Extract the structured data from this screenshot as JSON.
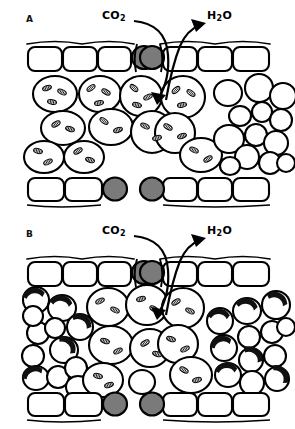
{
  "figure": {
    "background_color": "#ffffff",
    "line_color": "#000000",
    "guard_cell_fill": "#7a7a7a",
    "cell_fill": "#ffffff",
    "hatch_color": "#1a1a1a",
    "width": 295,
    "height": 429
  },
  "panels": [
    {
      "id": "A",
      "letter": "A",
      "description": "Leaf cross-section with normal mesophyll cells containing chloroplasts and open spongy mesophyll",
      "labels": {
        "co2": {
          "text": "CO",
          "sub": "2",
          "full": "CO2"
        },
        "h2o": {
          "text": "H",
          "sub": "2",
          "suffix": "O",
          "full": "H2O"
        }
      },
      "arrows": [
        {
          "name": "co2-influx-arrow",
          "direction": "into-stoma",
          "label": "CO2"
        },
        {
          "name": "h2o-efflux-arrow",
          "direction": "out-of-stoma",
          "label": "H2O"
        }
      ],
      "tissue": {
        "upper_epidermis_cells": 6,
        "lower_epidermis_cells": 6,
        "guard_cells_top": 2,
        "guard_cells_bottom": 2,
        "mesophyll_cells_with_chloroplasts": 11,
        "spongy_cells_empty": 13,
        "stoma_state": "open"
      }
    },
    {
      "id": "B",
      "letter": "B",
      "description": "Leaf cross-section with thick-walled hatched cells and dense spongy mesophyll",
      "labels": {
        "co2": {
          "text": "CO",
          "sub": "2",
          "full": "CO2"
        },
        "h2o": {
          "text": "H",
          "sub": "2",
          "suffix": "O",
          "full": "H2O"
        }
      },
      "arrows": [
        {
          "name": "co2-influx-arrow",
          "direction": "into-stoma",
          "label": "CO2"
        },
        {
          "name": "h2o-efflux-arrow",
          "direction": "out-of-stoma",
          "label": "H2O"
        }
      ],
      "tissue": {
        "upper_epidermis_cells": 6,
        "lower_epidermis_cells": 6,
        "guard_cells_top": 2,
        "guard_cells_bottom": 2,
        "mesophyll_cells_with_chloroplasts": 9,
        "thick_walled_hatched_cells": 12,
        "spongy_cells_empty": 16,
        "stoma_state": "open"
      }
    }
  ]
}
